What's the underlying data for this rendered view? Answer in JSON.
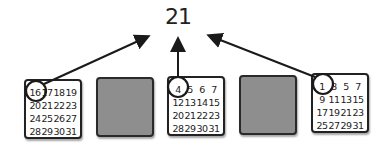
{
  "diagram": {
    "result": "21",
    "cards": [
      {
        "id": "card-1",
        "color": "white",
        "numbers": [
          "16",
          "17",
          "18",
          "19",
          "20",
          "21",
          "22",
          "23",
          "24",
          "25",
          "26",
          "27",
          "28",
          "29",
          "30",
          "31"
        ],
        "circled": "16"
      },
      {
        "id": "card-2",
        "color": "gray",
        "numbers": []
      },
      {
        "id": "card-3",
        "color": "white",
        "numbers": [
          "4",
          "5",
          "6",
          "7",
          "12",
          "13",
          "14",
          "15",
          "20",
          "21",
          "22",
          "23",
          "28",
          "29",
          "30",
          "31"
        ],
        "circled": "4"
      },
      {
        "id": "card-4",
        "color": "gray",
        "numbers": []
      },
      {
        "id": "card-5",
        "color": "white",
        "numbers": [
          "1",
          "3",
          "5",
          "7",
          "9",
          "11",
          "13",
          "15",
          "17",
          "19",
          "21",
          "23",
          "25",
          "27",
          "29",
          "31"
        ],
        "circled": "1"
      }
    ],
    "arrows": [
      {
        "from": "card-1 circled 16",
        "to": "result"
      },
      {
        "from": "card-3 circled 4",
        "to": "result"
      },
      {
        "from": "card-5 circled 1",
        "to": "result"
      }
    ],
    "colors": {
      "gray_card": "#8e8e8e",
      "stroke": "#222222"
    }
  }
}
